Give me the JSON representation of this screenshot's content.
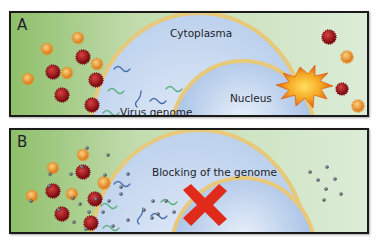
{
  "panels": [
    {
      "id": "A",
      "letter": "A",
      "labels": {
        "cytoplasm": "Cytoplasma",
        "nucleus": "Nucleus",
        "virus_genome": "Virus genome"
      }
    },
    {
      "id": "B",
      "letter": "B",
      "labels": {
        "blocking": "Blocking of the genome"
      }
    }
  ],
  "colors": {
    "outside_left": "#8fbf6a",
    "outside_right": "#d8ead2",
    "cytoplasm": "#c5d8ee",
    "nucleus": "#a9c3e6",
    "membrane": "#e8c97a",
    "virus_red": "#a0141a",
    "virus_orange": "#e8922a",
    "burst": "#f2a020",
    "block_x": "#e02a1a",
    "blocker_particle": "#555a66",
    "genome_blue": "#4a6fb0",
    "genome_green": "#5fb080"
  },
  "icons": {
    "red_virus": "red-spiky-virus-icon",
    "orange_virus": "orange-virus-icon",
    "burst": "explosion-icon",
    "block": "red-x-icon",
    "blocker": "blocker-particle-icon"
  }
}
